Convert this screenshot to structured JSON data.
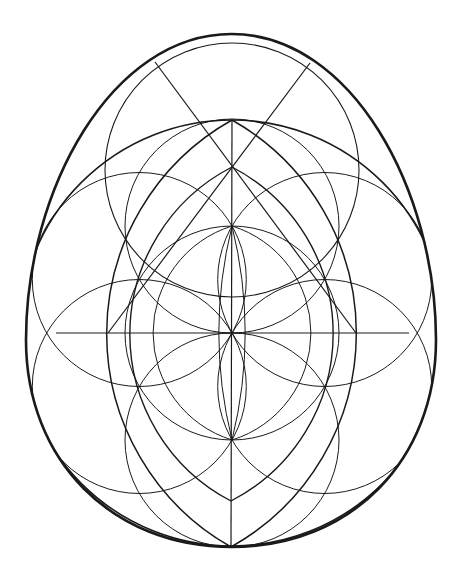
{
  "diagram": {
    "title": "",
    "background": "#ffffff",
    "stroke_color": "#1a1a1a",
    "egg": {
      "top": [
        232,
        34
      ],
      "bottom": [
        231,
        547
      ],
      "left_x": 26,
      "right_x": 436,
      "stroke_width": 2.6
    },
    "center": [
      232,
      333
    ],
    "big_circle": {
      "cx": 232,
      "cy": 333,
      "r": 213,
      "stroke_width": 1.6
    },
    "top_circle": {
      "cx": 232,
      "cy": 170,
      "r": 127,
      "stroke_width": 1.1
    },
    "flower_of_life": {
      "r": 107,
      "circles": [
        {
          "cx": 232,
          "cy": 333
        },
        {
          "cx": 232,
          "cy": 226
        },
        {
          "cx": 232,
          "cy": 440
        },
        {
          "cx": 139.3,
          "cy": 279.5
        },
        {
          "cx": 324.7,
          "cy": 279.5
        },
        {
          "cx": 139.3,
          "cy": 386.5
        },
        {
          "cx": 324.7,
          "cy": 386.5
        }
      ]
    },
    "lines": [
      {
        "name": "horizontal-axis",
        "x1": 56,
        "y1": 333,
        "x2": 409,
        "y2": 333
      },
      {
        "name": "vertical-axis",
        "x1": 232,
        "y1": 120,
        "x2": 231,
        "y2": 547
      },
      {
        "name": "diagonal-left-to-right",
        "x1": 155,
        "y1": 62,
        "x2": 356,
        "y2": 333
      },
      {
        "name": "diagonal-right-to-left",
        "x1": 310,
        "y1": 63,
        "x2": 108,
        "y2": 333
      }
    ],
    "pointed_arches": [
      {
        "name": "outer-arch",
        "top": [
          232,
          120
        ],
        "bottom": [
          231,
          547
        ],
        "r": 245,
        "stroke_width": 1.5
      },
      {
        "name": "inner-arch",
        "top": [
          232,
          167
        ],
        "bottom": [
          231,
          501
        ],
        "r": 188,
        "stroke_width": 1.4
      },
      {
        "name": "middle-arch",
        "top": [
          232,
          226
        ],
        "bottom": [
          232,
          440
        ],
        "r": 112,
        "stroke_width": 1.0
      },
      {
        "name": "center-lens",
        "top": [
          232,
          226
        ],
        "bottom": [
          232,
          440
        ],
        "r": 447,
        "stroke_width": 1.0
      }
    ]
  }
}
